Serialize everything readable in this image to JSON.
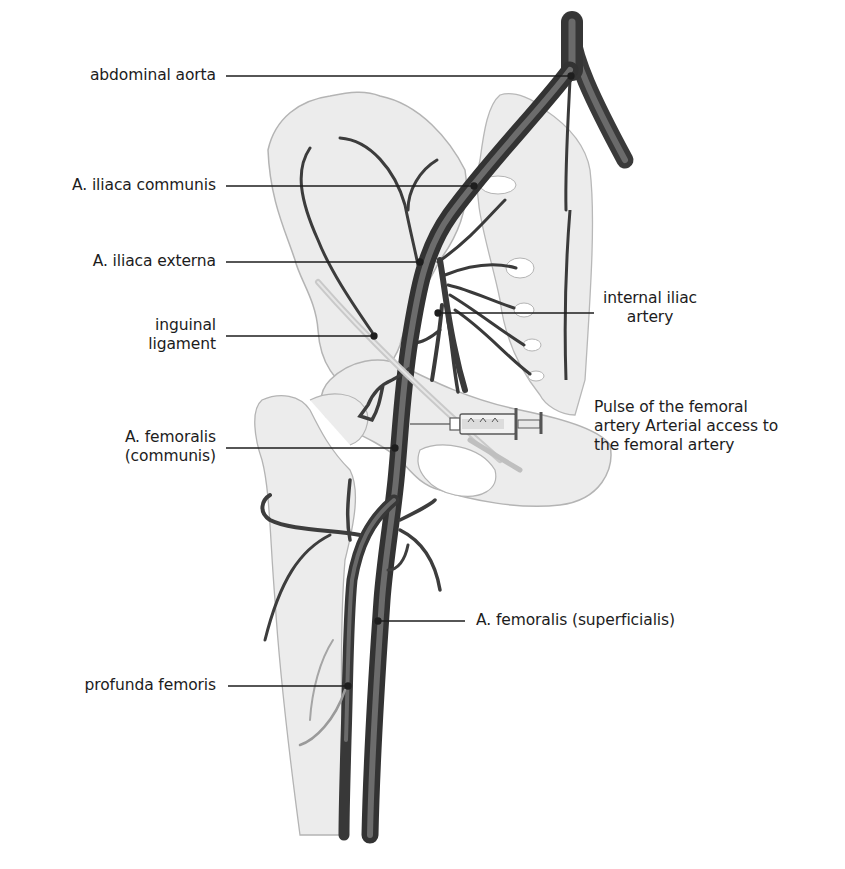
{
  "diagram": {
    "colors": {
      "background": "#ffffff",
      "bone_fill": "#ececec",
      "bone_outline": "#b4b4b4",
      "artery_dark": "#3a3a3a",
      "artery_mid": "#5e5e5e",
      "leader_line": "#1e1e1e",
      "text": "#1c1c1c"
    },
    "labels": {
      "abdominal_aorta": "abdominal aorta",
      "iliaca_communis": "A. iliaca communis",
      "iliaca_externa": "A. iliaca externa",
      "inguinal_ligament": "inguinal\nligament",
      "internal_iliac": "internal iliac\nartery",
      "femoral_pulse": "Pulse of the femoral\nartery Arterial access to\nthe femoral artery",
      "femoralis_communis": "A. femoralis\n(communis)",
      "femoralis_superficialis": "A. femoralis (superficialis)",
      "profunda_femoris": "profunda femoris"
    },
    "illustration_elements": [
      "pelvis-bone",
      "sacrum",
      "femur",
      "abdominal-aorta",
      "common-iliac-artery",
      "external-iliac-artery",
      "internal-iliac-artery",
      "inguinal-ligament",
      "syringe",
      "common-femoral-artery",
      "superficial-femoral-artery",
      "deep-femoral-artery"
    ]
  }
}
